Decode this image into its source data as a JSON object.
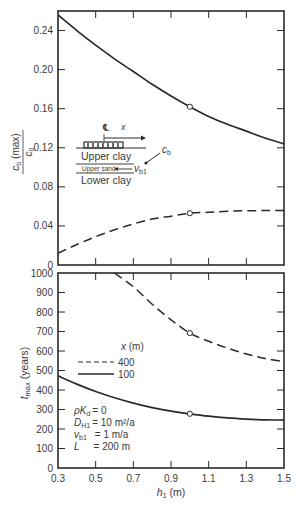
{
  "chart_data": [
    {
      "type": "line",
      "panel": "top",
      "title": "",
      "xlabel": "",
      "ylabel": "c_b (max) / c_0",
      "xlim": [
        0.3,
        1.5
      ],
      "ylim": [
        0,
        0.26
      ],
      "x_ticks": [
        0.3,
        0.5,
        0.7,
        0.9,
        1.1,
        1.3,
        1.5
      ],
      "y_ticks": [
        0,
        0.04,
        0.08,
        0.12,
        0.16,
        0.2,
        0.24
      ],
      "y_tick_labels": [
        "0",
        "0.04",
        "0.08",
        "0.12",
        "0.16",
        "0.20",
        "0.24"
      ],
      "grid": false,
      "series": [
        {
          "name": "x = 100 m",
          "style": "solid",
          "x": [
            0.3,
            0.4,
            0.5,
            0.6,
            0.7,
            0.8,
            0.9,
            1.0,
            1.1,
            1.2,
            1.3,
            1.4,
            1.5
          ],
          "y": [
            0.256,
            0.24,
            0.225,
            0.211,
            0.198,
            0.185,
            0.173,
            0.162,
            0.152,
            0.144,
            0.137,
            0.13,
            0.124
          ],
          "marker_at": [
            1.0,
            0.162
          ]
        },
        {
          "name": "x = 400 m",
          "style": "dashed",
          "x": [
            0.3,
            0.4,
            0.5,
            0.6,
            0.7,
            0.8,
            0.9,
            1.0,
            1.1,
            1.2,
            1.3,
            1.4,
            1.5
          ],
          "y": [
            0.012,
            0.021,
            0.029,
            0.036,
            0.042,
            0.047,
            0.05,
            0.053,
            0.054,
            0.055,
            0.0555,
            0.0557,
            0.0558
          ],
          "marker_at": [
            1.0,
            0.053
          ]
        }
      ],
      "inset": {
        "labels": [
          "Upper clay",
          "Upper sand",
          "Lower clay"
        ],
        "centerline": "℄",
        "axis_label": "x",
        "cb_label": "c",
        "cb_sub": "b",
        "vb_label": "v",
        "vb_sub": "b1"
      }
    },
    {
      "type": "line",
      "panel": "bottom",
      "title": "",
      "xlabel": "h₁ (m)",
      "ylabel": "t_max (years)",
      "xlim": [
        0.3,
        1.5
      ],
      "ylim": [
        0,
        1000
      ],
      "x_ticks": [
        0.3,
        0.5,
        0.7,
        0.9,
        1.1,
        1.3,
        1.5
      ],
      "x_tick_labels": [
        "0.3",
        "0.5",
        "0.7",
        "0.9",
        "1.1",
        "1.3",
        "1.5"
      ],
      "y_ticks": [
        0,
        100,
        200,
        300,
        400,
        500,
        600,
        700,
        800,
        900,
        1000
      ],
      "y_tick_labels": [
        "0",
        "100",
        "200",
        "300",
        "400",
        "500",
        "600",
        "700",
        "800",
        "900",
        "1000"
      ],
      "grid": false,
      "legend": {
        "title": "x (m)",
        "position": "center-left",
        "entries": [
          {
            "label": "400",
            "style": "dashed"
          },
          {
            "label": "100",
            "style": "solid"
          }
        ]
      },
      "series": [
        {
          "name": "400",
          "style": "dashed",
          "x": [
            0.6,
            0.7,
            0.8,
            0.9,
            1.0,
            1.1,
            1.2,
            1.3,
            1.4,
            1.5
          ],
          "y": [
            1000,
            930,
            840,
            760,
            692,
            650,
            615,
            585,
            562,
            545
          ],
          "marker_at": [
            1.0,
            692
          ]
        },
        {
          "name": "100",
          "style": "solid",
          "x": [
            0.3,
            0.4,
            0.5,
            0.6,
            0.7,
            0.8,
            0.9,
            1.0,
            1.1,
            1.2,
            1.3,
            1.4,
            1.5
          ],
          "y": [
            473,
            430,
            392,
            360,
            333,
            310,
            292,
            278,
            266,
            257,
            251,
            247,
            246
          ],
          "marker_at": [
            1.0,
            278
          ]
        }
      ],
      "annotations": [
        {
          "lhs": "ρK",
          "sub": "d",
          "rhs": "= 0"
        },
        {
          "lhs": "D",
          "sub": "H1",
          "rhs": "= 10 m²/a"
        },
        {
          "lhs": "v",
          "sub": "b1",
          "rhs": "= 1 m/a"
        },
        {
          "lhs": "L",
          "sub": "",
          "rhs": "= 200 m"
        }
      ]
    }
  ],
  "labels": {
    "top_ylabel_num": "c",
    "top_ylabel_num_sub": "b",
    "top_ylabel_num_tail": " (max)",
    "top_ylabel_den": "c",
    "top_ylabel_den_sub": "0",
    "bottom_ylabel": "t",
    "bottom_ylabel_sub": "max",
    "bottom_ylabel_tail": " (years)",
    "legend_title_x": "x",
    "legend_title_unit": " (m)",
    "xlabel_h": "h",
    "xlabel_sub": "1",
    "xlabel_unit": " (m)"
  }
}
